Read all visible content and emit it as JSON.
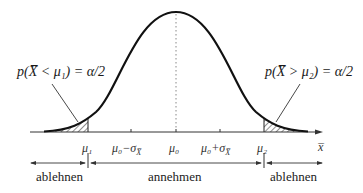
{
  "figure": {
    "annotations": {
      "left": "p(X̅ < μ₁) = α/2",
      "right": "p(X̅ > μ₂) = α/2"
    },
    "ticks": {
      "mu1": "μ₁",
      "mu0_minus": "μ₀−σ",
      "mu0": "μ₀",
      "mu0_plus": "μ₀+σ",
      "mu2": "μ₂",
      "sigma_sub": "X̅",
      "axis_label": "x̅"
    },
    "regions": {
      "left": "ablehnen",
      "middle": "annehmen",
      "right": "ablehnen"
    },
    "colors": {
      "line": "#111111",
      "axis": "#333333",
      "hatch": "#333333"
    }
  }
}
